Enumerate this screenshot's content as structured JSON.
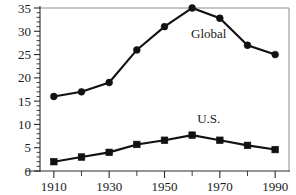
{
  "chart_data": {
    "type": "line",
    "title": "",
    "subtitle": "",
    "xlabel": "",
    "ylabel": "",
    "x": [
      1910,
      1920,
      1930,
      1940,
      1950,
      1960,
      1970,
      1980,
      1990
    ],
    "xlim": [
      1905,
      1995
    ],
    "ylim": [
      0,
      35
    ],
    "grid": false,
    "legend_position": "inline-annotation",
    "x_tick_labels": [
      "1910",
      "1930",
      "1950",
      "1970",
      "1990"
    ],
    "x_tick_values": [
      1910,
      1930,
      1950,
      1970,
      1990
    ],
    "x_minor_tick_values": [
      1920,
      1940,
      1960,
      1980
    ],
    "y_tick_labels": [
      "0",
      "5",
      "10",
      "15",
      "20",
      "25",
      "30",
      "35"
    ],
    "y_tick_values": [
      0,
      5,
      10,
      15,
      20,
      25,
      30,
      35
    ],
    "y_minor_tick_step": 1,
    "series": [
      {
        "name": "Global",
        "marker": "circle",
        "color": "#111111",
        "values": [
          16,
          17,
          19,
          26,
          31,
          35,
          32.8,
          27,
          25
        ]
      },
      {
        "name": "U.S.",
        "marker": "square",
        "color": "#111111",
        "values": [
          2,
          3,
          4,
          5.7,
          6.6,
          7.7,
          6.6,
          5.5,
          4.6
        ]
      }
    ],
    "annotations": [
      {
        "text": "Global",
        "x": 1966,
        "y": 28.6
      },
      {
        "text": "U.S.",
        "x": 1966,
        "y": 10.2
      }
    ]
  },
  "axis": {
    "y_labels": [
      "35",
      "30",
      "25",
      "20",
      "15",
      "10",
      "5",
      "0"
    ],
    "x_labels": [
      "1910",
      "1930",
      "1950",
      "1970",
      "1990"
    ]
  },
  "labels": {
    "global": "Global",
    "us": "U.S."
  }
}
